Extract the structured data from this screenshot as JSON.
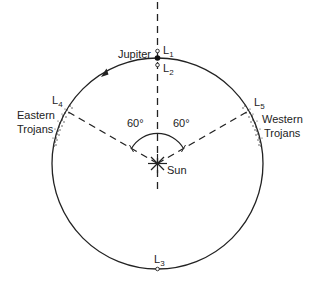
{
  "diagram": {
    "labels": {
      "jupiter": "Jupiter",
      "sun": "Sun",
      "eastern_line1": "Eastern",
      "eastern_line2": "Trojans",
      "western_line1": "Western",
      "western_line2": "Trojans",
      "angle_left": "60°",
      "angle_right": "60°"
    },
    "lagrange_points": [
      {
        "letter": "L",
        "index": "1"
      },
      {
        "letter": "L",
        "index": "2"
      },
      {
        "letter": "L",
        "index": "3"
      },
      {
        "letter": "L",
        "index": "4"
      },
      {
        "letter": "L",
        "index": "5"
      }
    ],
    "orbit_direction": "counterclockwise",
    "colors": {
      "line": "#222222",
      "background": "#ffffff"
    }
  }
}
